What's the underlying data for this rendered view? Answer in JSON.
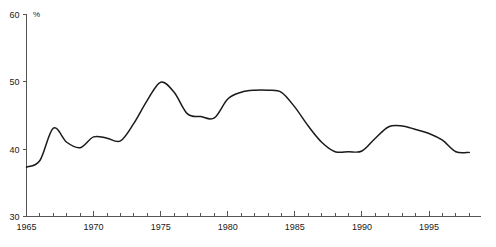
{
  "chart_data": {
    "type": "line",
    "title": "",
    "xlabel": "",
    "ylabel": "",
    "unit_label": "%",
    "xlim": [
      1965,
      1998.5
    ],
    "ylim": [
      30,
      60
    ],
    "grid": false,
    "legend": null,
    "y_ticks": [
      30,
      40,
      50,
      60
    ],
    "y_tick_labels": [
      "30",
      "40",
      "50",
      "60"
    ],
    "x_major_ticks": [
      1965,
      1970,
      1975,
      1980,
      1985,
      1990,
      1995
    ],
    "x_major_tick_labels": [
      "1965",
      "1970",
      "1975",
      "1980",
      "1985",
      "1990",
      "1995"
    ],
    "x_minor_tick_step": 1,
    "series": [
      {
        "name": "share",
        "color": "#1a1a1a",
        "x": [
          1965,
          1966,
          1967,
          1968,
          1969,
          1970,
          1971,
          1972,
          1973,
          1974,
          1975,
          1976,
          1977,
          1978,
          1979,
          1980,
          1981,
          1982,
          1983,
          1984,
          1985,
          1986,
          1987,
          1988,
          1989,
          1990,
          1991,
          1992,
          1993,
          1994,
          1995,
          1996,
          1997,
          1998
        ],
        "values": [
          37.3,
          38.3,
          43.1,
          41.0,
          40.2,
          41.8,
          41.6,
          41.2,
          43.8,
          47.2,
          49.9,
          48.4,
          45.2,
          44.8,
          44.6,
          47.4,
          48.4,
          48.7,
          48.7,
          48.4,
          46.2,
          43.4,
          41.0,
          39.6,
          39.6,
          39.7,
          41.6,
          43.3,
          43.4,
          42.9,
          42.3,
          41.3,
          39.6,
          39.5
        ]
      }
    ]
  },
  "axes": {
    "y_unit": "%"
  },
  "header": {
    "clipped_top_text": ""
  }
}
